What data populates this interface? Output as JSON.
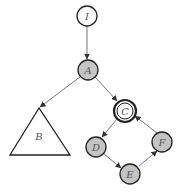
{
  "diagram": {
    "type": "graph",
    "colors": {
      "edge": "#777777",
      "node_stroke": "#222222",
      "node_fill_gray": "#c4c4c4",
      "node_fill_white": "#ffffff",
      "label": "#555555"
    },
    "nodes": [
      {
        "id": "I",
        "label": "I",
        "shape": "circle",
        "fill": "white"
      },
      {
        "id": "A",
        "label": "A",
        "shape": "circle",
        "fill": "gray"
      },
      {
        "id": "B",
        "label": "B",
        "shape": "triangle",
        "fill": "white"
      },
      {
        "id": "C",
        "label": "C",
        "shape": "double-circle",
        "fill": "white"
      },
      {
        "id": "D",
        "label": "D",
        "shape": "circle",
        "fill": "gray"
      },
      {
        "id": "E",
        "label": "E",
        "shape": "circle",
        "fill": "gray"
      },
      {
        "id": "F",
        "label": "F",
        "shape": "circle",
        "fill": "gray"
      }
    ],
    "edges": [
      {
        "from": "I",
        "to": "A"
      },
      {
        "from": "A",
        "to": "B"
      },
      {
        "from": "A",
        "to": "C"
      },
      {
        "from": "C",
        "to": "D"
      },
      {
        "from": "D",
        "to": "E"
      },
      {
        "from": "E",
        "to": "F"
      },
      {
        "from": "F",
        "to": "C"
      }
    ]
  }
}
